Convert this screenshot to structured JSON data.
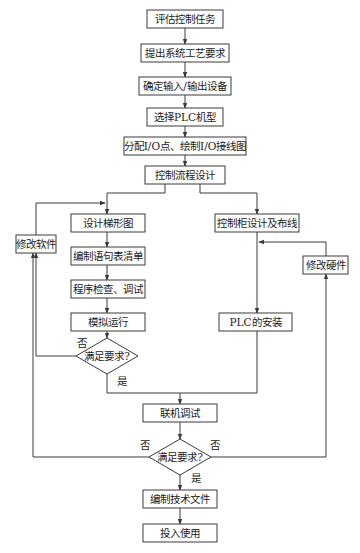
{
  "diagram": {
    "type": "flowchart",
    "colors": {
      "line": "#3a3a3a",
      "text": "#222222",
      "background": "#ffffff"
    },
    "nodes": [
      {
        "id": "n1",
        "shape": "rect",
        "label": "评估控制任务",
        "x": 147,
        "y": 10,
        "w": 76,
        "h": 18
      },
      {
        "id": "n2",
        "shape": "rect",
        "label": "提出系统工艺要求",
        "x": 141,
        "y": 44,
        "w": 88,
        "h": 18
      },
      {
        "id": "n3",
        "shape": "rect",
        "label": "确定输入/输出设备",
        "x": 139,
        "y": 77,
        "w": 92,
        "h": 18
      },
      {
        "id": "n4",
        "shape": "rect",
        "label": "选择PLC机型",
        "x": 147,
        "y": 108,
        "w": 76,
        "h": 18
      },
      {
        "id": "n5",
        "shape": "rect",
        "label": "分配I/O点、绘制I/O接线图",
        "x": 124,
        "y": 137,
        "w": 122,
        "h": 18
      },
      {
        "id": "n6",
        "shape": "rect",
        "label": "控制流程设计",
        "x": 145,
        "y": 166,
        "w": 80,
        "h": 18
      },
      {
        "id": "n7",
        "shape": "rect",
        "label": "设计梯形图",
        "x": 71,
        "y": 214,
        "w": 74,
        "h": 18
      },
      {
        "id": "n8",
        "shape": "rect",
        "label": "编制语句表清单",
        "x": 71,
        "y": 247,
        "w": 74,
        "h": 18
      },
      {
        "id": "n9",
        "shape": "rect",
        "label": "程序检查、调试",
        "x": 71,
        "y": 280,
        "w": 74,
        "h": 18
      },
      {
        "id": "n10",
        "shape": "rect",
        "label": "模拟运行",
        "x": 71,
        "y": 313,
        "w": 74,
        "h": 18
      },
      {
        "id": "n11",
        "shape": "diamond",
        "label": "满足要求?",
        "cx": 107,
        "cy": 356,
        "w": 62,
        "h": 36
      },
      {
        "id": "n12",
        "shape": "rect",
        "label": "修改软件",
        "x": 16,
        "y": 235,
        "w": 40,
        "h": 18
      },
      {
        "id": "n13",
        "shape": "rect",
        "label": "控制柜设计及布线",
        "x": 215,
        "y": 214,
        "w": 84,
        "h": 18
      },
      {
        "id": "n14",
        "shape": "rect",
        "label": "修改硬件",
        "x": 303,
        "y": 256,
        "w": 45,
        "h": 18
      },
      {
        "id": "n15",
        "shape": "rect",
        "label": "PLC的安装",
        "x": 219,
        "y": 313,
        "w": 73,
        "h": 18
      },
      {
        "id": "n16",
        "shape": "rect",
        "label": "联机调试",
        "x": 143,
        "y": 404,
        "w": 74,
        "h": 18
      },
      {
        "id": "n17",
        "shape": "diamond",
        "label": "满足要求?",
        "cx": 180,
        "cy": 457,
        "w": 62,
        "h": 36
      },
      {
        "id": "n18",
        "shape": "rect",
        "label": "编制技术文件",
        "x": 143,
        "y": 490,
        "w": 74,
        "h": 18
      },
      {
        "id": "n19",
        "shape": "rect",
        "label": "投入使用",
        "x": 143,
        "y": 524,
        "w": 74,
        "h": 18
      }
    ],
    "edges": [
      {
        "from": "n1",
        "to": "n2",
        "points": [
          [
            185,
            28
          ],
          [
            185,
            44
          ]
        ],
        "arrow": true
      },
      {
        "from": "n2",
        "to": "n3",
        "points": [
          [
            185,
            62
          ],
          [
            185,
            77
          ]
        ],
        "arrow": true
      },
      {
        "from": "n3",
        "to": "n4",
        "points": [
          [
            185,
            95
          ],
          [
            185,
            108
          ]
        ],
        "arrow": true
      },
      {
        "from": "n4",
        "to": "n5",
        "points": [
          [
            185,
            126
          ],
          [
            185,
            137
          ]
        ],
        "arrow": true
      },
      {
        "from": "n5",
        "to": "n6",
        "points": [
          [
            185,
            155
          ],
          [
            185,
            166
          ]
        ],
        "arrow": true
      },
      {
        "from": "n6",
        "to": "n7",
        "points": [
          [
            165,
            184
          ],
          [
            165,
            193
          ],
          [
            107,
            193
          ],
          [
            107,
            214
          ]
        ],
        "arrow": true
      },
      {
        "from": "n6",
        "to": "n13",
        "points": [
          [
            200,
            184
          ],
          [
            200,
            193
          ],
          [
            257,
            193
          ],
          [
            257,
            214
          ]
        ],
        "arrow": true
      },
      {
        "from": "n7",
        "to": "n8",
        "points": [
          [
            107,
            232
          ],
          [
            107,
            247
          ]
        ],
        "arrow": true
      },
      {
        "from": "n8",
        "to": "n9",
        "points": [
          [
            107,
            265
          ],
          [
            107,
            280
          ]
        ],
        "arrow": true
      },
      {
        "from": "n9",
        "to": "n10",
        "points": [
          [
            107,
            298
          ],
          [
            107,
            313
          ]
        ],
        "arrow": true
      },
      {
        "from": "n10",
        "to": "n11",
        "points": [
          [
            107,
            331
          ],
          [
            107,
            338
          ]
        ],
        "arrow": true
      },
      {
        "from": "n11",
        "to": "n12",
        "label": "否",
        "points": [
          [
            76,
            356
          ],
          [
            36,
            356
          ],
          [
            36,
            253
          ]
        ],
        "arrow": true
      },
      {
        "from": "n12",
        "to": "n7",
        "points": [
          [
            36,
            235
          ],
          [
            36,
            203
          ],
          [
            105,
            203
          ]
        ],
        "arrow": true
      },
      {
        "from": "n11",
        "to": "join",
        "label": "是",
        "points": [
          [
            107,
            374
          ],
          [
            107,
            393
          ],
          [
            180,
            393
          ]
        ],
        "arrow": false
      },
      {
        "from": "n13",
        "to": "n15",
        "points": [
          [
            257,
            232
          ],
          [
            257,
            313
          ]
        ],
        "arrow": true
      },
      {
        "from": "n15",
        "to": "join",
        "points": [
          [
            257,
            331
          ],
          [
            257,
            393
          ],
          [
            180,
            393
          ]
        ],
        "arrow": false
      },
      {
        "from": "join",
        "to": "n16",
        "points": [
          [
            180,
            393
          ],
          [
            180,
            404
          ]
        ],
        "arrow": true
      },
      {
        "from": "n16",
        "to": "n17",
        "points": [
          [
            180,
            422
          ],
          [
            180,
            439
          ]
        ],
        "arrow": true
      },
      {
        "from": "n17",
        "to": "n12",
        "label": "否",
        "points": [
          [
            149,
            457
          ],
          [
            33,
            457
          ],
          [
            33,
            253
          ]
        ],
        "arrow": true
      },
      {
        "from": "n17",
        "to": "n14",
        "label": "否",
        "points": [
          [
            211,
            457
          ],
          [
            326,
            457
          ],
          [
            326,
            274
          ]
        ],
        "arrow": true
      },
      {
        "from": "n14",
        "to": "n13",
        "points": [
          [
            326,
            256
          ],
          [
            326,
            242
          ],
          [
            259,
            242
          ]
        ],
        "arrow": true
      },
      {
        "from": "n17",
        "to": "n18",
        "label": "是",
        "points": [
          [
            180,
            475
          ],
          [
            180,
            490
          ]
        ],
        "arrow": true
      },
      {
        "from": "n18",
        "to": "n19",
        "points": [
          [
            180,
            508
          ],
          [
            180,
            524
          ]
        ],
        "arrow": true
      }
    ],
    "edge_labels": [
      {
        "text": "否",
        "x": 77,
        "y": 347
      },
      {
        "text": "是",
        "x": 117,
        "y": 385
      },
      {
        "text": "否",
        "x": 140,
        "y": 449
      },
      {
        "text": "否",
        "x": 210,
        "y": 449
      },
      {
        "text": "是",
        "x": 191,
        "y": 482
      }
    ]
  }
}
